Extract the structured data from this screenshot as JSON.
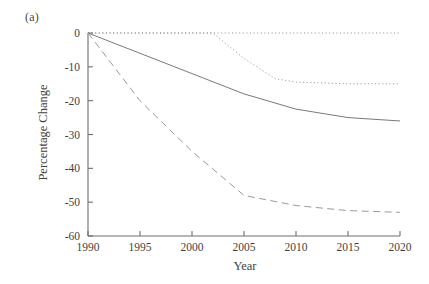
{
  "figure": {
    "panel_label": "(a)",
    "axis_color": "#6e6e6e"
  },
  "chart_data": {
    "type": "line",
    "title": "",
    "subtitle": "",
    "panel": "(a)",
    "xlabel": "Year",
    "ylabel": "Percentage Change",
    "xlim": [
      1990,
      2020
    ],
    "ylim": [
      -60,
      0
    ],
    "xticks": [
      1990,
      1995,
      2000,
      2005,
      2010,
      2015,
      2020
    ],
    "xticklabels": [
      "1990",
      "1995",
      "2000",
      "2005",
      "2010",
      "2015",
      "2020"
    ],
    "yticks": [
      0,
      -10,
      -20,
      -30,
      -40,
      -50,
      -60
    ],
    "yticklabels": [
      "0",
      "-10",
      "-20",
      "-30",
      "-40",
      "-50",
      "-60"
    ],
    "grid": false,
    "legend": false,
    "legend_position": "none",
    "x": [
      1990,
      1995,
      2000,
      2005,
      2010,
      2015,
      2020
    ],
    "series": [
      {
        "name": "baseline",
        "style": "dotted",
        "color": "#8d8d8d",
        "x": [
          1990,
          1995,
          2000,
          2002,
          2005,
          2010,
          2015,
          2020
        ],
        "values": [
          0,
          0,
          0,
          0,
          0,
          0,
          0,
          0
        ]
      },
      {
        "name": "low-reduction",
        "style": "dotted",
        "color": "#8d8d8d",
        "x": [
          1990,
          1995,
          2000,
          2002,
          2005,
          2008,
          2010,
          2015,
          2020
        ],
        "values": [
          0,
          0,
          0,
          0,
          -7.5,
          -13.5,
          -14.5,
          -15,
          -15
        ]
      },
      {
        "name": "mid-reduction",
        "style": "solid",
        "color": "#7a7a7a",
        "x": [
          1990,
          1995,
          2000,
          2005,
          2010,
          2015,
          2020
        ],
        "values": [
          0,
          -6,
          -12,
          -18,
          -22.5,
          -25,
          -26
        ]
      },
      {
        "name": "high-reduction",
        "style": "dashed",
        "color": "#9a9a9a",
        "x": [
          1990,
          1995,
          2000,
          2005,
          2010,
          2015,
          2020
        ],
        "values": [
          0,
          -20,
          -35,
          -48,
          -51,
          -52.5,
          -53
        ]
      }
    ]
  }
}
